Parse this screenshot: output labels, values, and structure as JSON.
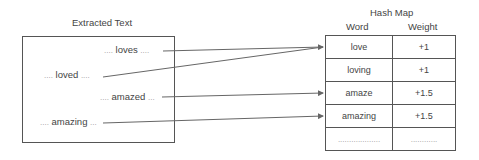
{
  "left_panel": {
    "title": "Extracted Text",
    "snippets": [
      {
        "pre": "....",
        "word": "loves",
        "post": "...."
      },
      {
        "pre": "....",
        "word": "loved",
        "post": "...."
      },
      {
        "pre": "....",
        "word": "amazed",
        "post": "..."
      },
      {
        "pre": "....",
        "word": "amazing",
        "post": "..."
      }
    ]
  },
  "hash_map": {
    "title": "Hash Map",
    "columns": [
      "Word",
      "Weight"
    ],
    "rows": [
      {
        "word": "love",
        "weight": "+1"
      },
      {
        "word": "loving",
        "weight": "+1"
      },
      {
        "word": "amaze",
        "weight": "+1.5"
      },
      {
        "word": "amazing",
        "weight": "+1.5"
      },
      {
        "word": "...................",
        "weight": "............"
      }
    ]
  },
  "arrows": [
    {
      "from": "loves",
      "to": "love"
    },
    {
      "from": "loved",
      "to": "love"
    },
    {
      "from": "amazed",
      "to": "amaze"
    },
    {
      "from": "amazing",
      "to": "amazing"
    }
  ],
  "colors": {
    "line": "#666666",
    "border": "#555555"
  }
}
